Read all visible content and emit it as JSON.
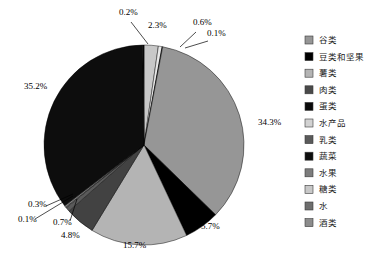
{
  "chart_data": {
    "type": "pie",
    "title": "",
    "subtitle": "",
    "xlabel": "",
    "ylabel": "",
    "legend_position": "right",
    "grid": false,
    "units": "percent",
    "total": "100.0%",
    "start_angle_deg": 0,
    "direction": "clockwise",
    "categories": [
      "谷类",
      "豆类和坚果",
      "薯类",
      "肉类",
      "蛋类",
      "水产品",
      "乳类",
      "蔬菜",
      "水果",
      "糖类",
      "水",
      "酒类"
    ],
    "values": [
      34.3,
      5.7,
      15.7,
      4.8,
      0.7,
      0.1,
      0.3,
      35.2,
      0.1,
      2.3,
      0.6,
      0.1
    ],
    "colors": [
      "#969696",
      "#000000",
      "#b4b4b4",
      "#424242",
      "#0a0a0a",
      "#d2d2d2",
      "#5a5a5a",
      "#0d0d0d",
      "#7d7d7d",
      "#c8c8c8",
      "#6e6e6e",
      "#8c8c8c"
    ],
    "slices": [
      {
        "label": "糖类",
        "value": 2.3,
        "display": "2.3%",
        "color": "#c8c8c8"
      },
      {
        "label": "水",
        "value": 0.6,
        "display": "0.6%",
        "color": "#e8e8e8"
      },
      {
        "label": "酒类",
        "value": 0.1,
        "display": "0.1%",
        "color": "#2b2b2b"
      },
      {
        "label": "谷类",
        "value": 34.3,
        "display": "34.3%",
        "color": "#969696"
      },
      {
        "label": "豆类和坚果",
        "value": 5.7,
        "display": "5.7%",
        "color": "#000000"
      },
      {
        "label": "薯类",
        "value": 15.7,
        "display": "15.7%",
        "color": "#b4b4b4"
      },
      {
        "label": "肉类",
        "value": 4.8,
        "display": "4.8%",
        "color": "#424242"
      },
      {
        "label": "乳类",
        "value": 0.7,
        "display": "0.7%",
        "color": "#5a5a5a"
      },
      {
        "label": "水产品",
        "value": 0.1,
        "display": "0.1%",
        "color": "#d2d2d2"
      },
      {
        "label": "水果",
        "value": 0.3,
        "display": "0.3%",
        "color": "#7d7d7d"
      },
      {
        "label": "蔬菜",
        "value": 35.2,
        "display": "35.2%",
        "color": "#0d0d0d"
      },
      {
        "label": "蛋类",
        "value": 0.2,
        "display": "0.2%",
        "color": "#0a0a0a"
      }
    ],
    "data_labels": [
      {
        "text": "0.2%",
        "x": 119,
        "y": 15
      },
      {
        "text": "2.3%",
        "x": 148,
        "y": 28
      },
      {
        "text": "0.6%",
        "x": 193,
        "y": 25
      },
      {
        "text": "0.1%",
        "x": 207,
        "y": 36
      },
      {
        "text": "34.3%",
        "x": 258,
        "y": 125
      },
      {
        "text": "5.7%",
        "x": 201,
        "y": 229
      },
      {
        "text": "15.7%",
        "x": 123,
        "y": 248
      },
      {
        "text": "4.8%",
        "x": 61,
        "y": 238
      },
      {
        "text": "0.7%",
        "x": 53,
        "y": 225
      },
      {
        "text": "0.1%",
        "x": 18,
        "y": 222
      },
      {
        "text": "0.3%",
        "x": 28,
        "y": 207
      },
      {
        "text": "35.2%",
        "x": 24,
        "y": 89
      }
    ]
  },
  "legend": {
    "items": [
      {
        "label": "谷类",
        "color": "#969696"
      },
      {
        "label": "豆类和坚果",
        "color": "#000000"
      },
      {
        "label": "薯类",
        "color": "#b4b4b4"
      },
      {
        "label": "肉类",
        "color": "#4a4a4a"
      },
      {
        "label": "蛋类",
        "color": "#0a0a0a"
      },
      {
        "label": "水产品",
        "color": "#d2d2d2"
      },
      {
        "label": "乳类",
        "color": "#5a5a5a"
      },
      {
        "label": "蔬菜",
        "color": "#0d0d0d"
      },
      {
        "label": "水果",
        "color": "#7d7d7d"
      },
      {
        "label": "糖类",
        "color": "#c8c8c8"
      },
      {
        "label": "水",
        "color": "#6e6e6e"
      },
      {
        "label": "酒类",
        "color": "#8c8c8c"
      }
    ]
  }
}
